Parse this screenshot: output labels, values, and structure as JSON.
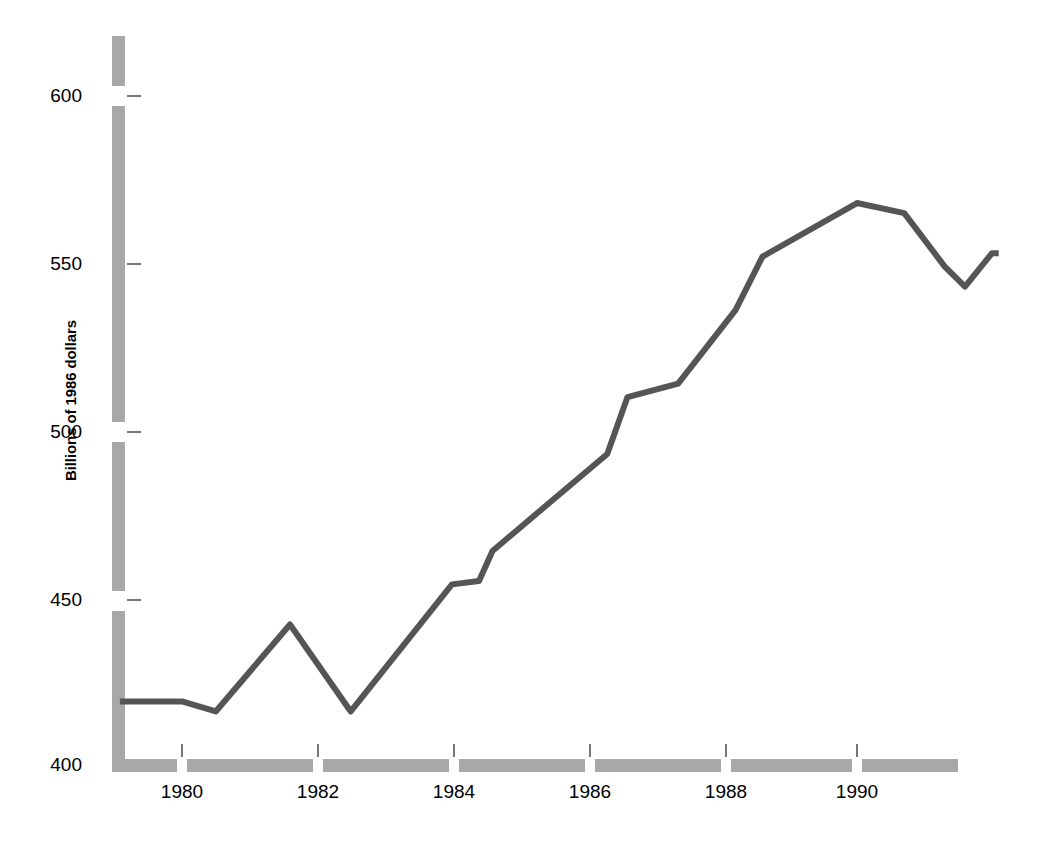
{
  "chart_data": {
    "type": "line",
    "title": "",
    "subtitle": "",
    "xlabel": "",
    "ylabel": "Billions of 1986 dollars",
    "xlim": [
      1979.08,
      1992.1
    ],
    "ylim": [
      400,
      615
    ],
    "xticks": [
      1980,
      1982,
      1984,
      1986,
      1988,
      1990
    ],
    "xticklabels": [
      "1980",
      "1982",
      "1984",
      "1986",
      "1988",
      "1990"
    ],
    "yticks": [
      400,
      450,
      500,
      550,
      600
    ],
    "yticklabels": [
      "400",
      "450",
      "500",
      "550",
      "600"
    ],
    "grid": false,
    "legend": null,
    "series": [
      {
        "name": "Billions of 1986 dollars",
        "color": "#555555",
        "x": [
          1979.08,
          1980.0,
          1980.5,
          1981.6,
          1982.5,
          1984.0,
          1984.4,
          1984.6,
          1986.3,
          1986.6,
          1987.35,
          1988.2,
          1988.6,
          1990.0,
          1990.7,
          1991.3,
          1991.6,
          1992.0,
          1992.1
        ],
        "values": [
          419,
          419,
          416,
          442,
          416,
          454,
          455,
          464,
          493,
          510,
          514,
          536,
          552,
          568,
          565,
          549,
          543,
          553,
          553
        ]
      }
    ],
    "annotations": []
  },
  "axes": {
    "y_axis_color": "#a8a8a8",
    "x_axis_color": "#a8a8a8",
    "line_color": "#555555",
    "text_color": "#000000",
    "background": "#ffffff"
  }
}
